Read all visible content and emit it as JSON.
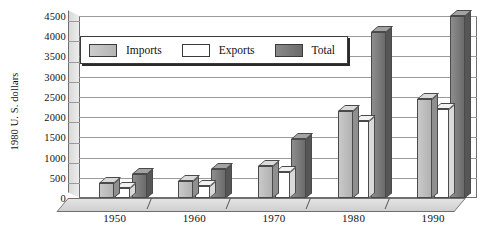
{
  "chart_data": {
    "type": "bar",
    "title": "",
    "xlabel": "",
    "ylabel": "1980 U. S. dollars",
    "categories": [
      "1950",
      "1960",
      "1970",
      "1980",
      "1990"
    ],
    "series": [
      {
        "name": "Imports",
        "color": "#c0c0c0",
        "values": [
          380,
          420,
          800,
          2150,
          2450
        ]
      },
      {
        "name": "Exports",
        "color": "#ffffff",
        "values": [
          250,
          300,
          650,
          1900,
          2200
        ]
      },
      {
        "name": "Total",
        "color": "#6f6f6f",
        "values": [
          600,
          720,
          1450,
          4100,
          4500
        ]
      }
    ],
    "ylim": [
      0,
      4500
    ],
    "yticks": [
      0,
      500,
      1000,
      1500,
      2000,
      2500,
      3000,
      3500,
      4000,
      4500
    ],
    "ytick_labels": [
      "0",
      "500",
      "1000",
      "1500",
      "2000",
      "2500",
      "3000",
      "3500",
      "4000",
      "4500"
    ],
    "grid": true,
    "legend_position": "top-left-inside",
    "style": "3d-clustered-column"
  },
  "legend": {
    "items": [
      {
        "label": "Imports",
        "swatch": "imports-swatch"
      },
      {
        "label": "Exports",
        "swatch": "exports-swatch"
      },
      {
        "label": "Total",
        "swatch": "total-swatch"
      }
    ]
  }
}
